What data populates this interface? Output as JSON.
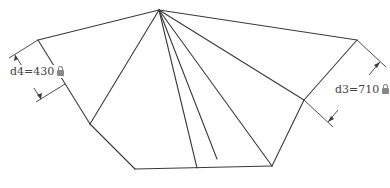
{
  "diagram": {
    "stroke_color": "#3a3a3a",
    "vertices": {
      "apex": [
        159,
        10
      ],
      "left_upper": [
        38,
        40
      ],
      "left_mid": [
        90,
        124
      ],
      "bottom_left": [
        135,
        169
      ],
      "bottom_right": [
        272,
        166
      ],
      "right_mid": [
        304,
        100
      ],
      "right_upper": [
        357,
        40
      ]
    },
    "dimensions": [
      {
        "id": "d4",
        "label": "d4=430",
        "locked": true
      },
      {
        "id": "d3",
        "label": "d3=710",
        "locked": true
      }
    ]
  }
}
